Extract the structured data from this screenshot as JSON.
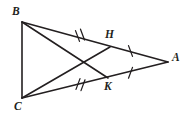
{
  "figure": {
    "background_color": "#ffffff",
    "stroke_color": "#231f20",
    "points": [
      {
        "id": "B",
        "label": "B",
        "x": 22,
        "y": 22
      },
      {
        "id": "C",
        "label": "C",
        "x": 22,
        "y": 98
      },
      {
        "id": "A",
        "label": "A",
        "x": 168,
        "y": 62
      },
      {
        "id": "H",
        "label": "H",
        "x": 110,
        "y": 47
      },
      {
        "id": "K",
        "label": "K",
        "x": 108,
        "y": 78
      }
    ],
    "segments": [
      {
        "id": "BC",
        "from": "B",
        "to": "C"
      },
      {
        "id": "BA",
        "from": "B",
        "to": "A"
      },
      {
        "id": "CA",
        "from": "C",
        "to": "A"
      },
      {
        "id": "CH",
        "from": "C",
        "to": "H"
      },
      {
        "id": "BK",
        "from": "B",
        "to": "K"
      }
    ],
    "tick_marks": [
      {
        "id": "tick-BH",
        "on_segment": "BH",
        "count": 2,
        "x": 80,
        "y": 36
      },
      {
        "id": "tick-HA",
        "on_segment": "HA",
        "count": 1,
        "x": 131,
        "y": 51
      },
      {
        "id": "tick-CK",
        "on_segment": "CK",
        "count": 2,
        "x": 80,
        "y": 84
      },
      {
        "id": "tick-KA",
        "on_segment": "KA",
        "count": 1,
        "x": 131,
        "y": 73
      }
    ],
    "intersection": {
      "id": "X",
      "x": 78,
      "y": 62
    }
  }
}
